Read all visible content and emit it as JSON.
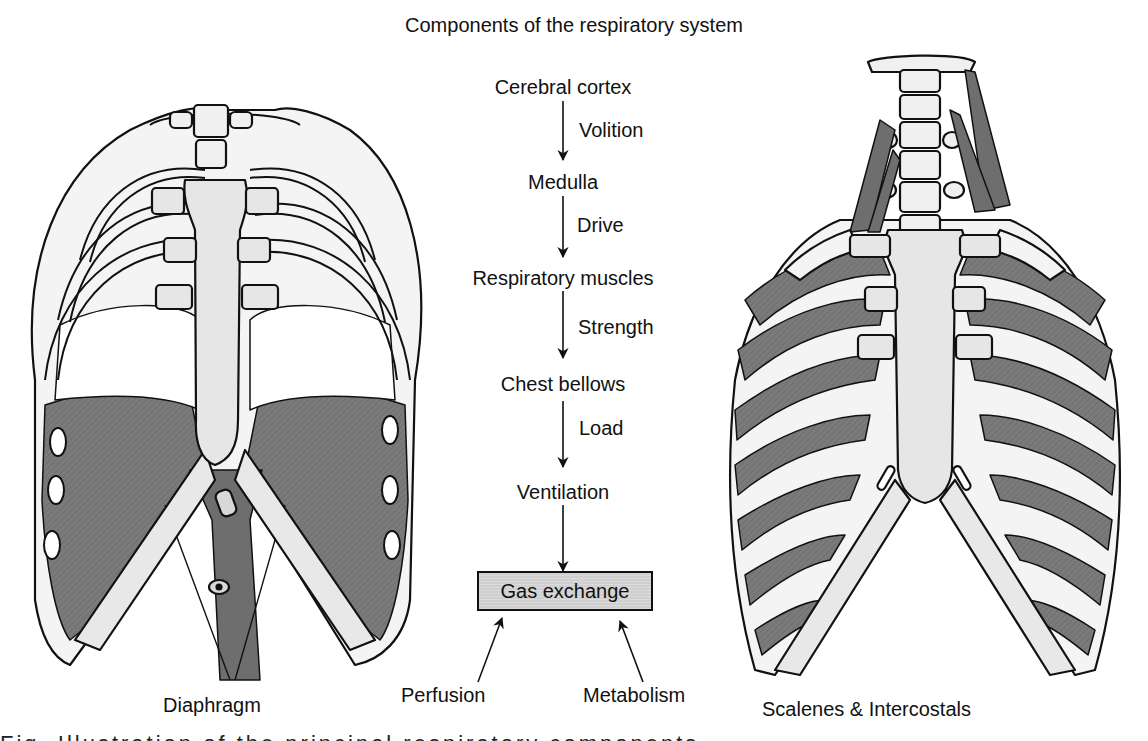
{
  "title": "Components of the respiratory system",
  "flow": {
    "nodes": [
      {
        "id": "cortex",
        "label": "Cerebral cortex"
      },
      {
        "id": "medulla",
        "label": "Medulla"
      },
      {
        "id": "muscles",
        "label": "Respiratory muscles"
      },
      {
        "id": "bellows",
        "label": "Chest bellows"
      },
      {
        "id": "ventilation",
        "label": "Ventilation"
      },
      {
        "id": "gas",
        "label": "Gas exchange"
      }
    ],
    "edges": [
      {
        "from": "cortex",
        "to": "medulla",
        "label": "Volition"
      },
      {
        "from": "medulla",
        "to": "muscles",
        "label": "Drive"
      },
      {
        "from": "muscles",
        "to": "bellows",
        "label": "Strength"
      },
      {
        "from": "bellows",
        "to": "ventilation",
        "label": "Load"
      },
      {
        "from": "ventilation",
        "to": "gas",
        "label": ""
      }
    ],
    "inputs": [
      {
        "label": "Perfusion",
        "to": "gas"
      },
      {
        "label": "Metabolism",
        "to": "gas"
      }
    ]
  },
  "figures": {
    "left": {
      "label": "Diaphragm"
    },
    "right": {
      "label": "Scalenes & Intercostals"
    }
  },
  "caption_partial": "Fig. Illustration of the principal respiratory components"
}
